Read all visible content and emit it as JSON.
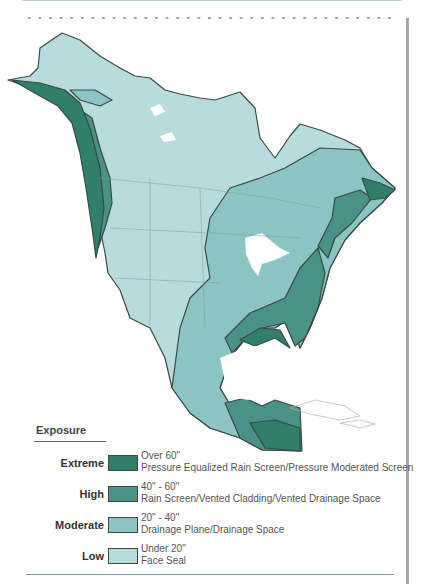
{
  "legend": {
    "title": "Exposure",
    "items": [
      {
        "level": "Extreme",
        "range": "Over 60\"",
        "description": "Pressure Equalized Rain Screen/Pressure Moderated Screen",
        "color": "#2f7f6a"
      },
      {
        "level": "High",
        "range": "40\" - 60\"",
        "description": "Rain Screen/Vented Cladding/Vented Drainage Space",
        "color": "#4a9186"
      },
      {
        "level": "Moderate",
        "range": "20\" - 40\"",
        "description": "Drainage Plane/Drainage Space",
        "color": "#8cc4c4"
      },
      {
        "level": "Low",
        "range": "Under 20\"",
        "description": "Face Seal",
        "color": "#b8dcdc"
      }
    ]
  },
  "map": {
    "region": "North America",
    "subject": "Rain exposure zones (annual precipitation)"
  }
}
